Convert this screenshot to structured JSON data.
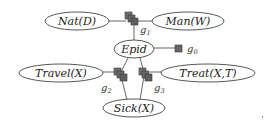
{
  "diagram": {
    "type": "factor-graph",
    "colors": {
      "factor_fill": "#6b6b6b",
      "edge": "#555555",
      "node_stroke": "#444444"
    },
    "nodes": [
      {
        "id": "nat",
        "label": "Nat(D)"
      },
      {
        "id": "man",
        "label": "Man(W)"
      },
      {
        "id": "epid",
        "label": "Epid"
      },
      {
        "id": "travel",
        "label": "Travel(X)"
      },
      {
        "id": "treat",
        "label": "Treat(X,T)"
      },
      {
        "id": "sick",
        "label": "Sick(X)"
      }
    ],
    "factors": [
      {
        "id": "g0",
        "base": "g",
        "sub": "0",
        "connects": [
          "epid"
        ]
      },
      {
        "id": "g1",
        "base": "g",
        "sub": "1",
        "connects": [
          "nat",
          "man",
          "epid"
        ]
      },
      {
        "id": "g2",
        "base": "g",
        "sub": "2",
        "connects": [
          "travel",
          "epid",
          "sick"
        ]
      },
      {
        "id": "g3",
        "base": "g",
        "sub": "3",
        "connects": [
          "treat",
          "epid",
          "sick"
        ]
      }
    ]
  }
}
